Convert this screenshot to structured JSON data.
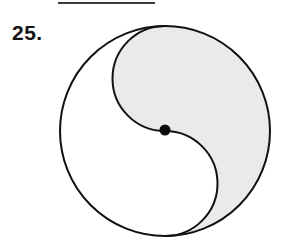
{
  "page": {
    "background_color": "#ffffff",
    "width": 293,
    "height": 246
  },
  "top_rule": {
    "label": "page-scan-artifact-bar",
    "color": "#3b3b3b",
    "x": 58,
    "y": 2,
    "width": 97,
    "height": 2
  },
  "problem": {
    "number_label": "25.",
    "text_color": "#131313"
  },
  "figure": {
    "outline_color": "#111111",
    "outline_width": 2,
    "shaded_fill": "#eaeaea",
    "unshaded_fill": "#ffffff",
    "dot_color": "#0d0d0d",
    "circle": {
      "center_x": 165,
      "center_y": 131,
      "radius": 105,
      "diameter": 210
    },
    "s_curve": {
      "description": "two half-radius semicircles joining top of circle to bottom of circle through center",
      "lobe_radius": 52.5,
      "upper_lobe_center_x": 165,
      "upper_lobe_center_y": 78.5,
      "lower_lobe_center_x": 165,
      "lower_lobe_center_y": 183.5
    },
    "center_dot": {
      "center_x": 165,
      "center_y": 130,
      "radius": 5.5
    },
    "regions": [
      {
        "name": "shaded-region",
        "position": "upper-right",
        "fill": "#eaeaea"
      },
      {
        "name": "unshaded-region",
        "position": "lower-left",
        "fill": "#ffffff"
      }
    ]
  }
}
